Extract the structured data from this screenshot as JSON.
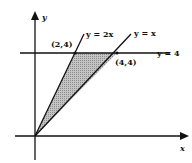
{
  "diagram": {
    "type": "region-between-lines",
    "axes": {
      "x_label": "x",
      "y_label": "y"
    },
    "lines": [
      {
        "equation": "y = 2x",
        "label": "y = 2x"
      },
      {
        "equation": "y = x",
        "label": "y = x"
      },
      {
        "equation": "y = 4",
        "label": "y = 4"
      }
    ],
    "points": [
      {
        "label": "(2,4)",
        "x": 2,
        "y": 4
      },
      {
        "label": "(4,4)",
        "x": 4,
        "y": 4
      }
    ],
    "shaded_region": {
      "vertices": [
        [
          0,
          0
        ],
        [
          2,
          4
        ],
        [
          4,
          4
        ]
      ],
      "fill": "#b0b0b0"
    },
    "colors": {
      "line": "#111111",
      "shade": "#b0b0b0",
      "background": "#ffffff"
    }
  }
}
